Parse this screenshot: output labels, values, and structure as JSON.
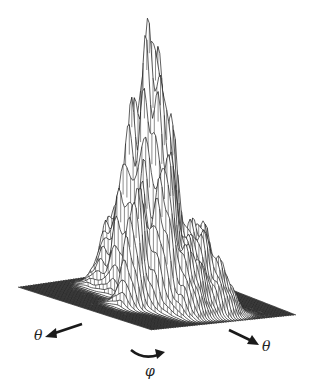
{
  "figure": {
    "axes": {
      "theta_left": "θ",
      "theta_right": "θ",
      "phi": "φ"
    },
    "colors": {
      "line": "#1a1a1a",
      "background": "#ffffff",
      "floor": "#3a3a3a"
    },
    "surface_peaks": [
      {
        "u": 0.5,
        "v": 0.55,
        "height": 1.0,
        "width": 0.055
      },
      {
        "u": 0.42,
        "v": 0.5,
        "height": 0.7,
        "width": 0.05
      },
      {
        "u": 0.6,
        "v": 0.52,
        "height": 0.66,
        "width": 0.05
      },
      {
        "u": 0.35,
        "v": 0.58,
        "height": 0.6,
        "width": 0.05
      },
      {
        "u": 0.67,
        "v": 0.6,
        "height": 0.55,
        "width": 0.05
      },
      {
        "u": 0.28,
        "v": 0.45,
        "height": 0.42,
        "width": 0.06
      },
      {
        "u": 0.72,
        "v": 0.42,
        "height": 0.38,
        "width": 0.06
      },
      {
        "u": 0.2,
        "v": 0.55,
        "height": 0.3,
        "width": 0.06
      },
      {
        "u": 0.8,
        "v": 0.55,
        "height": 0.25,
        "width": 0.06
      },
      {
        "u": 0.45,
        "v": 0.35,
        "height": 0.45,
        "width": 0.05
      },
      {
        "u": 0.55,
        "v": 0.7,
        "height": 0.5,
        "width": 0.05
      },
      {
        "u": 0.15,
        "v": 0.4,
        "height": 0.22,
        "width": 0.06
      },
      {
        "u": 0.85,
        "v": 0.38,
        "height": 0.18,
        "width": 0.06
      }
    ]
  }
}
